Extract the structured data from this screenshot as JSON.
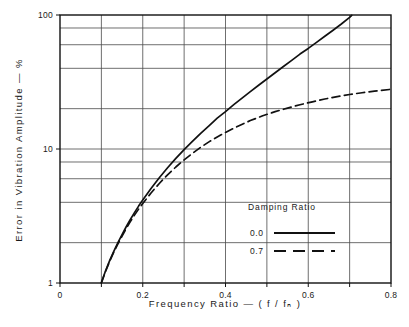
{
  "chart_data": {
    "type": "line",
    "title": "",
    "xlabel": "Frequency  Ratio  —  ( f / fₙ )",
    "ylabel": "Error  in  Vibration  Amplitude  —  %",
    "xlim": [
      0,
      0.8
    ],
    "ylim": [
      1,
      100
    ],
    "yscale": "log",
    "xscale": "linear",
    "grid": true,
    "x_ticks": [
      0,
      0.1,
      0.2,
      0.3,
      0.4,
      0.5,
      0.6,
      0.7,
      0.8
    ],
    "x_tick_labels": [
      "0",
      "",
      "0.2",
      "",
      "0.4",
      "",
      "0.6",
      "",
      "0.8"
    ],
    "x_gridlines": [
      0.1,
      0.2,
      0.3,
      0.4,
      0.5,
      0.6,
      0.7
    ],
    "y_ticks": [
      1,
      2,
      4,
      6,
      8,
      10,
      20,
      40,
      60,
      80,
      100
    ],
    "y_tick_labels": [
      "1",
      "",
      "",
      "",
      "",
      "10",
      "",
      "",
      "",
      "",
      "100"
    ],
    "y_gridlines": [
      2,
      4,
      6,
      8,
      10,
      20,
      40,
      60,
      80
    ],
    "legend": {
      "title": "Damping  Ratio",
      "position": "inside-lower-right",
      "entries": [
        {
          "label": "0.0",
          "style": "solid"
        },
        {
          "label": "0.7",
          "style": "dashed"
        }
      ]
    },
    "series": [
      {
        "name": "0.0",
        "damping_ratio": 0.0,
        "style": "solid",
        "color": "#111111",
        "points": [
          {
            "x": 0.1,
            "y": 1.01
          },
          {
            "x": 0.11,
            "y": 1.23
          },
          {
            "x": 0.12,
            "y": 1.47
          },
          {
            "x": 0.13,
            "y": 1.72
          },
          {
            "x": 0.14,
            "y": 2.0
          },
          {
            "x": 0.15,
            "y": 2.3
          },
          {
            "x": 0.16,
            "y": 2.63
          },
          {
            "x": 0.17,
            "y": 2.98
          },
          {
            "x": 0.18,
            "y": 3.35
          },
          {
            "x": 0.19,
            "y": 3.75
          },
          {
            "x": 0.2,
            "y": 4.17
          },
          {
            "x": 0.22,
            "y": 5.08
          },
          {
            "x": 0.24,
            "y": 6.1
          },
          {
            "x": 0.26,
            "y": 7.24
          },
          {
            "x": 0.28,
            "y": 8.51
          },
          {
            "x": 0.3,
            "y": 9.89
          },
          {
            "x": 0.32,
            "y": 11.4
          },
          {
            "x": 0.34,
            "y": 13.1
          },
          {
            "x": 0.36,
            "y": 14.9
          },
          {
            "x": 0.38,
            "y": 17.0
          },
          {
            "x": 0.4,
            "y": 19.0
          },
          {
            "x": 0.42,
            "y": 21.4
          },
          {
            "x": 0.44,
            "y": 24.0
          },
          {
            "x": 0.46,
            "y": 26.8
          },
          {
            "x": 0.48,
            "y": 29.9
          },
          {
            "x": 0.5,
            "y": 33.3
          },
          {
            "x": 0.52,
            "y": 37.1
          },
          {
            "x": 0.54,
            "y": 41.3
          },
          {
            "x": 0.56,
            "y": 45.9
          },
          {
            "x": 0.58,
            "y": 51.1
          },
          {
            "x": 0.6,
            "y": 56.3
          },
          {
            "x": 0.62,
            "y": 62.5
          },
          {
            "x": 0.64,
            "y": 69.4
          },
          {
            "x": 0.66,
            "y": 77.0
          },
          {
            "x": 0.68,
            "y": 85.7
          },
          {
            "x": 0.7,
            "y": 96.1
          },
          {
            "x": 0.705,
            "y": 99.5
          }
        ]
      },
      {
        "name": "0.7",
        "damping_ratio": 0.7,
        "style": "dashed",
        "color": "#111111",
        "points": [
          {
            "x": 0.1,
            "y": 1.0
          },
          {
            "x": 0.11,
            "y": 1.22
          },
          {
            "x": 0.12,
            "y": 1.45
          },
          {
            "x": 0.13,
            "y": 1.7
          },
          {
            "x": 0.14,
            "y": 1.96
          },
          {
            "x": 0.15,
            "y": 2.24
          },
          {
            "x": 0.16,
            "y": 2.55
          },
          {
            "x": 0.17,
            "y": 2.87
          },
          {
            "x": 0.18,
            "y": 3.21
          },
          {
            "x": 0.19,
            "y": 3.56
          },
          {
            "x": 0.2,
            "y": 3.92
          },
          {
            "x": 0.22,
            "y": 4.7
          },
          {
            "x": 0.24,
            "y": 5.53
          },
          {
            "x": 0.26,
            "y": 6.42
          },
          {
            "x": 0.28,
            "y": 7.34
          },
          {
            "x": 0.3,
            "y": 8.3
          },
          {
            "x": 0.32,
            "y": 9.28
          },
          {
            "x": 0.34,
            "y": 10.3
          },
          {
            "x": 0.36,
            "y": 11.3
          },
          {
            "x": 0.38,
            "y": 12.3
          },
          {
            "x": 0.4,
            "y": 13.3
          },
          {
            "x": 0.43,
            "y": 14.8
          },
          {
            "x": 0.46,
            "y": 16.3
          },
          {
            "x": 0.49,
            "y": 17.7
          },
          {
            "x": 0.52,
            "y": 19.0
          },
          {
            "x": 0.55,
            "y": 20.2
          },
          {
            "x": 0.58,
            "y": 21.4
          },
          {
            "x": 0.61,
            "y": 22.5
          },
          {
            "x": 0.64,
            "y": 23.6
          },
          {
            "x": 0.67,
            "y": 24.6
          },
          {
            "x": 0.7,
            "y": 25.5
          },
          {
            "x": 0.73,
            "y": 26.3
          },
          {
            "x": 0.76,
            "y": 27.0
          },
          {
            "x": 0.8,
            "y": 27.9
          }
        ]
      }
    ]
  },
  "caption": {
    "partial_text": ""
  }
}
